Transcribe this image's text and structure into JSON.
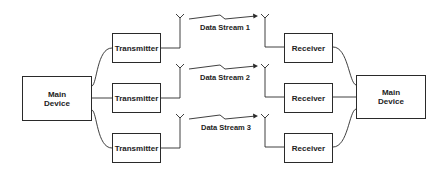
{
  "diagram": {
    "type": "block-diagram",
    "source": {
      "label_line1": "Main",
      "label_line2": "Device"
    },
    "sink": {
      "label_line1": "Main",
      "label_line2": "Device"
    },
    "transmitters": [
      {
        "label": "Transmitter"
      },
      {
        "label": "Transmitter"
      },
      {
        "label": "Transmitter"
      }
    ],
    "receivers": [
      {
        "label": "Receiver"
      },
      {
        "label": "Receiver"
      },
      {
        "label": "Receiver"
      }
    ],
    "streams": [
      {
        "label": "Data Stream 1"
      },
      {
        "label": "Data Stream 2"
      },
      {
        "label": "Data Stream 3"
      }
    ],
    "line_color": "#2a2a2a"
  }
}
